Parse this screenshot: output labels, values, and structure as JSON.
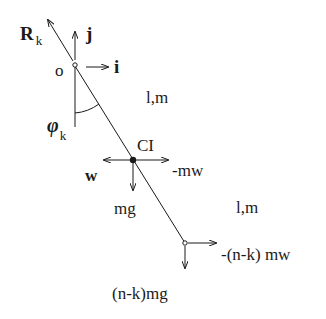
{
  "diagram": {
    "type": "pendulum-free-body-diagram",
    "colors": {
      "ink": "#1a1a1a",
      "background": "#ffffff"
    },
    "labels": {
      "reaction": "R",
      "reaction_sub": "k",
      "unit_j": "j",
      "unit_i": "i",
      "origin": "o",
      "angle": "φ",
      "angle_sub": "k",
      "segment_upper": "l,m",
      "segment_lower": "l,m",
      "center": "CI",
      "w_left": "w",
      "inertia_right": "-mw",
      "gravity": "mg",
      "tail_force": "-(n-k) mw",
      "tail_gravity": "(n-k)mg"
    }
  }
}
